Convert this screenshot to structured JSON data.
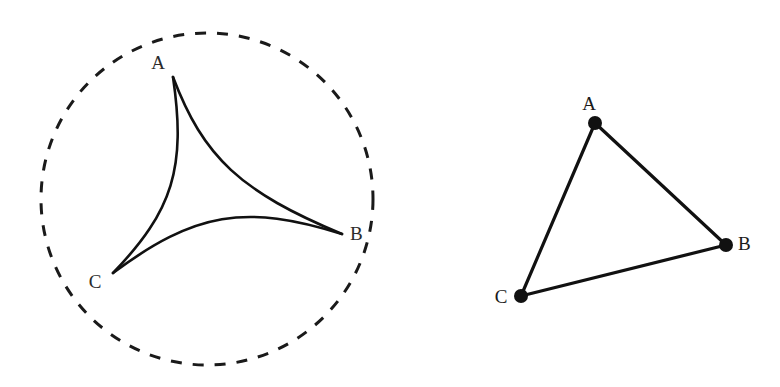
{
  "figure": {
    "background_color": "#ffffff",
    "stroke_color": "#111111",
    "label_color": "#2b2b2b",
    "canvas": {
      "width": 780,
      "height": 387
    }
  },
  "left_figure": {
    "name": "deltoid-in-dashed-circle",
    "circle": {
      "center_x": 207,
      "center_y": 199,
      "radius": 166,
      "stroke_color": "#1a1a1a",
      "stroke_width": 3,
      "dash_pattern": "11 11",
      "style": "dashed"
    },
    "cusps": [
      {
        "label": "A",
        "x": 173,
        "y": 77,
        "label_x": 158,
        "label_y": 69
      },
      {
        "label": "B",
        "x": 342,
        "y": 234,
        "label_x": 350,
        "label_y": 240
      },
      {
        "label": "C",
        "x": 113,
        "y": 273,
        "label_x": 95,
        "label_y": 288
      }
    ],
    "arcs": [
      {
        "from": "A",
        "to": "B",
        "control_x": 212,
        "control_y": 180,
        "sag": 37,
        "bulge": "inward"
      },
      {
        "from": "B",
        "to": "C",
        "control_x": 218,
        "control_y": 195,
        "sag": 34,
        "bulge": "inward"
      },
      {
        "from": "C",
        "to": "A",
        "control_x": 190,
        "control_y": 193,
        "sag": 35,
        "bulge": "inward"
      }
    ],
    "arc_stroke_width": 2.6
  },
  "right_figure": {
    "name": "chord-triangle",
    "vertices": [
      {
        "label": "A",
        "x": 595,
        "y": 123,
        "label_x": 589,
        "label_y": 110,
        "dot_radius": 7
      },
      {
        "label": "B",
        "x": 726,
        "y": 245,
        "label_x": 738,
        "label_y": 250,
        "dot_radius": 7
      },
      {
        "label": "C",
        "x": 521,
        "y": 296,
        "label_x": 501,
        "label_y": 303,
        "dot_radius": 7
      }
    ],
    "edges": [
      {
        "from": "A",
        "to": "B"
      },
      {
        "from": "B",
        "to": "C"
      },
      {
        "from": "C",
        "to": "A"
      }
    ],
    "edge_stroke_width": 3.2,
    "dot_color": "#111111"
  }
}
